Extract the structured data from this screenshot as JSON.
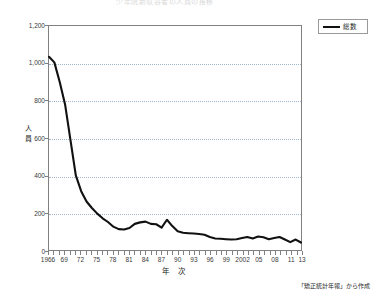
{
  "chart_data": {
    "type": "line",
    "title": "少年院新収容者の人員の推移",
    "xlabel": "年 次",
    "ylabel": "人員",
    "ylim": [
      0,
      1200
    ],
    "ytick_labels": [
      "0",
      "200",
      "400",
      "600",
      "800",
      "1,000",
      "1,200"
    ],
    "yticks": [
      0,
      200,
      400,
      600,
      800,
      1000,
      1200
    ],
    "grid": "horizontal-dotted",
    "legend_position": "top-right",
    "legend": [
      "総数"
    ],
    "xtick_labels": [
      "1966",
      "69",
      "72",
      "75",
      "78",
      "81",
      "84",
      "87",
      "90",
      "93",
      "96",
      "99",
      "2002",
      "05",
      "08",
      "11",
      "13"
    ],
    "xtick_years": [
      1966,
      1969,
      1972,
      1975,
      1978,
      1981,
      1984,
      1987,
      1990,
      1993,
      1996,
      1999,
      2002,
      2005,
      2008,
      2011,
      2013
    ],
    "x": [
      1966,
      1967,
      1968,
      1969,
      1970,
      1971,
      1972,
      1973,
      1974,
      1975,
      1976,
      1977,
      1978,
      1979,
      1980,
      1981,
      1982,
      1983,
      1984,
      1985,
      1986,
      1987,
      1988,
      1989,
      1990,
      1991,
      1992,
      1993,
      1994,
      1995,
      1996,
      1997,
      1998,
      1999,
      2000,
      2001,
      2002,
      2003,
      2004,
      2005,
      2006,
      2007,
      2008,
      2009,
      2010,
      2011,
      2012,
      2013
    ],
    "series": [
      {
        "name": "総数",
        "color": "#111111",
        "values": [
          1035,
          1005,
          900,
          780,
          590,
          400,
          315,
          260,
          225,
          195,
          170,
          150,
          125,
          112,
          110,
          118,
          140,
          148,
          152,
          140,
          138,
          120,
          162,
          128,
          100,
          92,
          90,
          88,
          86,
          82,
          70,
          62,
          60,
          58,
          56,
          58,
          64,
          70,
          62,
          72,
          68,
          58,
          64,
          70,
          56,
          42,
          56,
          40
        ]
      }
    ],
    "source_note": "「矯正統計年報」から作成"
  },
  "colors": {
    "line": "#111111",
    "axis": "#808080",
    "grid": "#9fb6cd",
    "text": "#1a1a1a",
    "title": "#d9d9d9"
  }
}
